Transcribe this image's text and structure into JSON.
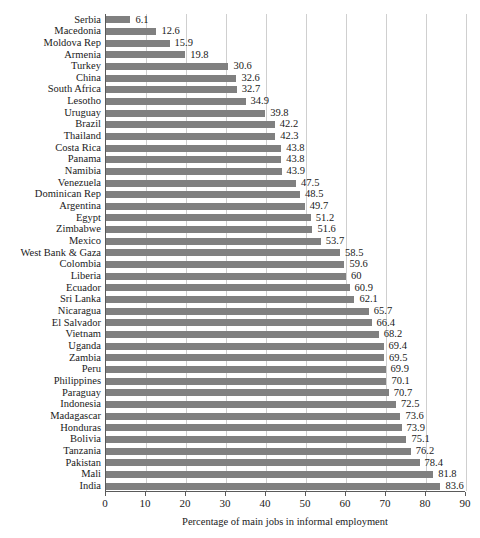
{
  "chart_data": {
    "type": "bar",
    "orientation": "horizontal",
    "title": "",
    "xlabel": "Percentage of main jobs in informal employment",
    "ylabel": "",
    "xlim": [
      0,
      90
    ],
    "xticks": [
      0,
      10,
      20,
      30,
      40,
      50,
      60,
      70,
      80,
      90
    ],
    "grid": "vertical",
    "legend": "none",
    "bar_color": "#808080",
    "gridline_color": "#cfcfcf",
    "axis_color": "#5a5a5a",
    "show_value_labels": true,
    "categories": [
      "Serbia",
      "Macedonia",
      "Moldova Rep",
      "Armenia",
      "Turkey",
      "China",
      "South Africa",
      "Lesotho",
      "Uruguay",
      "Brazil",
      "Thailand",
      "Costa Rica",
      "Panama",
      "Namibia",
      "Venezuela",
      "Dominican Rep",
      "Argentina",
      "Egypt",
      "Zimbabwe",
      "Mexico",
      "West Bank & Gaza",
      "Colombia",
      "Liberia",
      "Ecuador",
      "Sri Lanka",
      "Nicaragua",
      "El Salvador",
      "Vietnam",
      "Uganda",
      "Zambia",
      "Peru",
      "Philippines",
      "Paraguay",
      "Indonesia",
      "Madagascar",
      "Honduras",
      "Bolivia",
      "Tanzania",
      "Pakistan",
      "Mali",
      "India"
    ],
    "values": [
      6.1,
      12.6,
      15.9,
      19.8,
      30.6,
      32.6,
      32.7,
      34.9,
      39.8,
      42.2,
      42.3,
      43.8,
      43.8,
      43.9,
      47.5,
      48.5,
      49.7,
      51.2,
      51.6,
      53.7,
      58.5,
      59.6,
      60,
      60.9,
      62.1,
      65.7,
      66.4,
      68.2,
      69.4,
      69.5,
      69.9,
      70.1,
      70.7,
      72.5,
      73.6,
      73.9,
      75.1,
      76.2,
      78.4,
      81.8,
      83.6
    ],
    "value_labels": [
      "6.1",
      "12.6",
      "15.9",
      "19.8",
      "30.6",
      "32.6",
      "32.7",
      "34.9",
      "39.8",
      "42.2",
      "42.3",
      "43.8",
      "43.8",
      "43.9",
      "47.5",
      "48.5",
      "49.7",
      "51.2",
      "51.6",
      "53.7",
      "58.5",
      "59.6",
      "60",
      "60.9",
      "62.1",
      "65.7",
      "66.4",
      "68.2",
      "69.4",
      "69.5",
      "69.9",
      "70.1",
      "70.7",
      "72.5",
      "73.6",
      "73.9",
      "75.1",
      "76.2",
      "78.4",
      "81.8",
      "83.6"
    ]
  }
}
